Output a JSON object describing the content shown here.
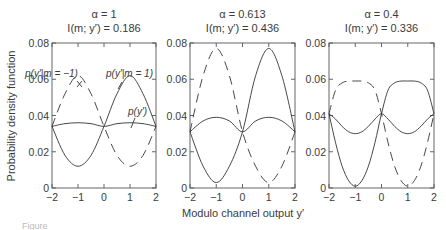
{
  "chart_data": {
    "type": "line",
    "ylabel": "Probability density function",
    "xlabel": "Modulo channel output y′",
    "caption": "Figure",
    "panels": [
      {
        "title_line1": "α = 1",
        "title_line2": "I(m; y′) = 0.186",
        "alpha": 1,
        "mutual_information": 0.186,
        "xlim": [
          -2,
          2
        ],
        "ylim": [
          0,
          0.08
        ],
        "xticks": [
          "−2",
          "−1",
          "0",
          "1",
          "2"
        ],
        "yticks": [
          "0",
          "0.02",
          "0.04",
          "0.06",
          "0.08"
        ],
        "annotations": [
          "p(y′|m = −1)",
          "p(y′|m = 1)",
          "p(y′)"
        ],
        "x": [
          -2,
          -1.5,
          -1,
          -0.5,
          0,
          0.5,
          1,
          1.5,
          2
        ],
        "series": [
          {
            "name": "p(y'|m=1)",
            "style": "solid",
            "values": [
              0.034,
              0.018,
              0.012,
              0.018,
              0.034,
              0.052,
              0.062,
              0.052,
              0.034
            ]
          },
          {
            "name": "p(y'|m=-1)",
            "style": "dashed",
            "values": [
              0.034,
              0.052,
              0.062,
              0.052,
              0.034,
              0.018,
              0.012,
              0.018,
              0.034
            ]
          },
          {
            "name": "p(y')",
            "style": "solid",
            "values": [
              0.034,
              0.0355,
              0.036,
              0.0355,
              0.034,
              0.0355,
              0.036,
              0.0355,
              0.034
            ]
          }
        ]
      },
      {
        "title_line1": "α = 0.613",
        "title_line2": "I(m; y′) = 0.436",
        "alpha": 0.613,
        "mutual_information": 0.436,
        "xlim": [
          -2,
          2
        ],
        "ylim": [
          0,
          0.08
        ],
        "xticks": [
          "−2",
          "−1",
          "0",
          "1",
          "2"
        ],
        "yticks": [
          "0",
          "0.02",
          "0.04",
          "0.06",
          "0.08"
        ],
        "annotations": [],
        "x": [
          -2,
          -1.5,
          -1,
          -0.5,
          0,
          0.5,
          1,
          1.5,
          2
        ],
        "series": [
          {
            "name": "p(y'|m=1)",
            "style": "solid",
            "values": [
              0.031,
              0.012,
              0.003,
              0.012,
              0.031,
              0.062,
              0.077,
              0.062,
              0.031
            ]
          },
          {
            "name": "p(y'|m=-1)",
            "style": "dashed",
            "values": [
              0.031,
              0.062,
              0.077,
              0.062,
              0.031,
              0.012,
              0.003,
              0.012,
              0.031
            ]
          },
          {
            "name": "p(y')",
            "style": "solid",
            "values": [
              0.031,
              0.037,
              0.039,
              0.037,
              0.031,
              0.037,
              0.039,
              0.037,
              0.031
            ]
          }
        ]
      },
      {
        "title_line1": "α = 0.4",
        "title_line2": "I(m; y′) = 0.336",
        "alpha": 0.4,
        "mutual_information": 0.336,
        "xlim": [
          -2,
          2
        ],
        "ylim": [
          0,
          0.08
        ],
        "xticks": [
          "−2",
          "−1",
          "0",
          "1",
          "2"
        ],
        "yticks": [
          "0",
          "0.02",
          "0.04",
          "0.06",
          "0.08"
        ],
        "annotations": [],
        "x": [
          -2,
          -1.75,
          -1.5,
          -1.25,
          -1,
          -0.75,
          -0.5,
          -0.25,
          0,
          0.25,
          0.5,
          0.75,
          1,
          1.25,
          1.5,
          1.75,
          2
        ],
        "series": [
          {
            "name": "p(y'|m=1)",
            "style": "solid",
            "values": [
              0.041,
              0.025,
              0.012,
              0.004,
              0.001,
              0.004,
              0.012,
              0.025,
              0.041,
              0.054,
              0.058,
              0.059,
              0.059,
              0.059,
              0.058,
              0.054,
              0.041
            ]
          },
          {
            "name": "p(y'|m=-1)",
            "style": "dashed",
            "values": [
              0.041,
              0.054,
              0.058,
              0.059,
              0.059,
              0.059,
              0.058,
              0.054,
              0.041,
              0.025,
              0.012,
              0.004,
              0.001,
              0.004,
              0.012,
              0.025,
              0.041
            ]
          },
          {
            "name": "p(y')",
            "style": "solid",
            "values": [
              0.041,
              0.038,
              0.034,
              0.031,
              0.03,
              0.031,
              0.034,
              0.038,
              0.041,
              0.038,
              0.034,
              0.031,
              0.03,
              0.031,
              0.034,
              0.038,
              0.041
            ]
          }
        ]
      }
    ]
  }
}
